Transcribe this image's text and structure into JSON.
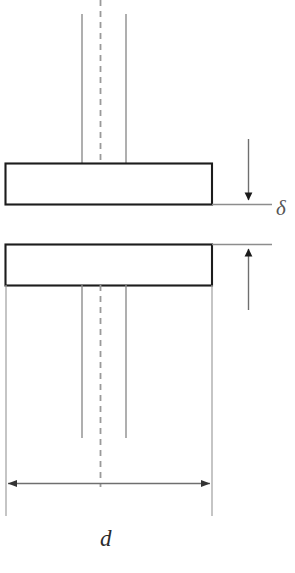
{
  "figure": {
    "type": "engineering-cross-section"
  },
  "labels": {
    "gap_symbol": "δ",
    "diameter_symbol": "d"
  },
  "colors": {
    "plate_stroke": "#1a1a1a",
    "thin_line": "#8a8a8a",
    "center_line": "#9a9a9a",
    "dimension_line": "#6f6f6f",
    "background": "#ffffff",
    "label_text": "#2b2b2b"
  },
  "geometry": {
    "plate_top": {
      "x": 5,
      "y": 163,
      "width": 207,
      "height": 41
    },
    "plate_bottom": {
      "x": 5,
      "y": 244,
      "width": 207,
      "height": 41
    },
    "center_line_x": 100,
    "shaft_left_x": 82,
    "shaft_right_x": 126,
    "gap_arrow_x": 248,
    "diameter_line_y": 483,
    "diameter_span": [
      8,
      212
    ]
  }
}
